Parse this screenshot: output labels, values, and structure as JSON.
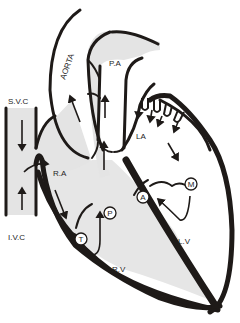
{
  "diagram": {
    "colors": {
      "wall": "#1e1a18",
      "deoxygenated_fill": "#e4e4e4",
      "oxygenated_fill": "#ffffff",
      "background": "#ffffff"
    },
    "labels": {
      "aorta": "AORTA",
      "pulmonary_artery": "P.A",
      "superior_vena_cava": "S.V.C",
      "inferior_vena_cava": "I.V.C",
      "right_atrium": "R.A",
      "left_atrium": "LA",
      "right_ventricle": "R.V",
      "left_ventricle": "L.V"
    },
    "valves": [
      {
        "key": "T",
        "name": "tricuspid",
        "label": "T"
      },
      {
        "key": "P",
        "name": "pulmonary",
        "label": "P"
      },
      {
        "key": "A",
        "name": "aortic",
        "label": "A"
      },
      {
        "key": "M",
        "name": "mitral",
        "label": "M"
      }
    ],
    "flow_arrows": [
      "svc-down",
      "ivc-up",
      "ra-curve-right",
      "ra-to-rv",
      "rv-up-pa",
      "pa-up",
      "aorta-up",
      "pulmonary-veins-into-la",
      "la-to-lv",
      "lv-to-aorta"
    ]
  }
}
